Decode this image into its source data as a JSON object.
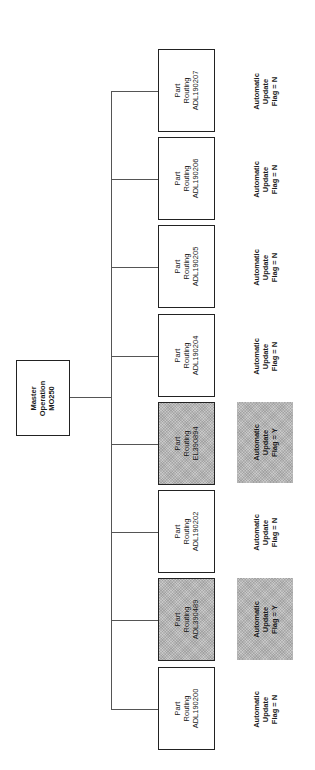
{
  "diagram": {
    "orientation": "rotated -90deg (landscape page shown portrait)",
    "master": {
      "line1": "Master",
      "line2": "Operation",
      "line3": "MO250"
    },
    "children": [
      {
        "line1": "Part",
        "line2": "Routing",
        "line3": "ADL190207",
        "flag_line1": "Automatic",
        "flag_line2": "Update",
        "flag_line3": "Flag = N",
        "highlighted": false
      },
      {
        "line1": "Part",
        "line2": "Routing",
        "line3": "ADL190206",
        "flag_line1": "Automatic",
        "flag_line2": "Update",
        "flag_line3": "Flag = N",
        "highlighted": false
      },
      {
        "line1": "Part",
        "line2": "Routing",
        "line3": "ADL190205",
        "flag_line1": "Automatic",
        "flag_line2": "Update",
        "flag_line3": "Flag = N",
        "highlighted": false
      },
      {
        "line1": "Part",
        "line2": "Routing",
        "line3": "ADL190204",
        "flag_line1": "Automatic",
        "flag_line2": "Update",
        "flag_line3": "Flag = N",
        "highlighted": false
      },
      {
        "line1": "Part",
        "line2": "Routing",
        "line3": "EL390894",
        "flag_line1": "Automatic",
        "flag_line2": "Update",
        "flag_line3": "Flag = Y",
        "highlighted": true
      },
      {
        "line1": "Part",
        "line2": "Routing",
        "line3": "ADL190202",
        "flag_line1": "Automatic",
        "flag_line2": "Update",
        "flag_line3": "Flag = N",
        "highlighted": false
      },
      {
        "line1": "Part",
        "line2": "Routing",
        "line3": "ADL390489",
        "flag_line1": "Automatic",
        "flag_line2": "Update",
        "flag_line3": "Flag = Y",
        "highlighted": true
      },
      {
        "line1": "Part",
        "line2": "Routing",
        "line3": "ADL190200",
        "flag_line1": "Automatic",
        "flag_line2": "Update",
        "flag_line3": "Flag = N",
        "highlighted": false
      }
    ],
    "colors": {
      "box_border": "#222222",
      "connector": "#555555",
      "highlight_fill": "#c8c8c8",
      "background": "#ffffff"
    }
  }
}
